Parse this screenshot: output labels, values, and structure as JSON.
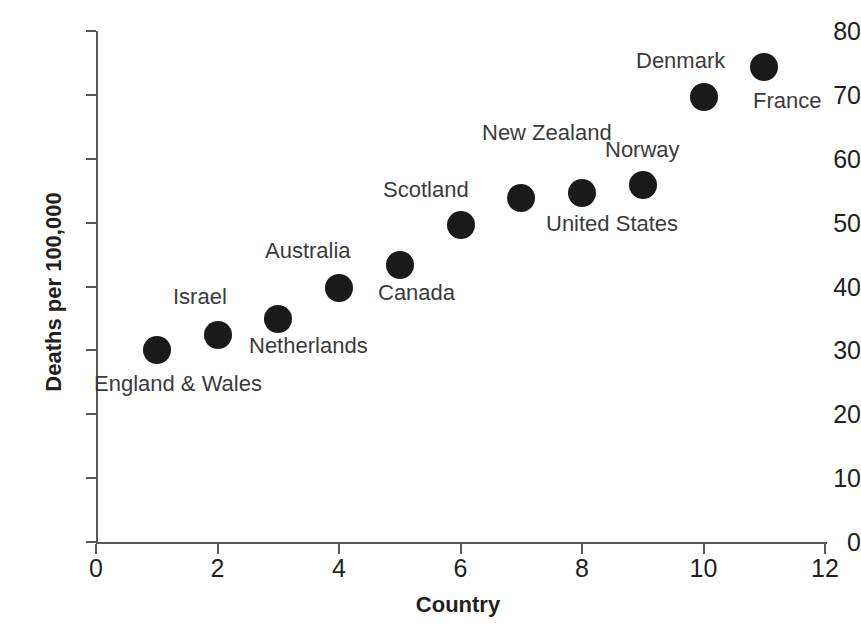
{
  "chart_data": {
    "type": "scatter",
    "title": "",
    "xlabel": "Country",
    "ylabel": "Deaths per 100,000",
    "xlim": [
      0,
      12
    ],
    "ylim": [
      0,
      80
    ],
    "xticks": [
      0,
      2,
      4,
      6,
      8,
      10,
      12
    ],
    "yticks": [
      0,
      10,
      20,
      30,
      40,
      50,
      60,
      70,
      80
    ],
    "grid": false,
    "legend": "none",
    "marker_color": "#1a1a1a",
    "axis_color": "#58595b",
    "points": [
      {
        "label": "England & Wales",
        "x": 1,
        "y": 30.0
      },
      {
        "label": "Israel",
        "x": 2,
        "y": 32.4
      },
      {
        "label": "Netherlands",
        "x": 3,
        "y": 34.9
      },
      {
        "label": "Australia",
        "x": 4,
        "y": 39.7
      },
      {
        "label": "Canada",
        "x": 5,
        "y": 43.4
      },
      {
        "label": "Scotland",
        "x": 6,
        "y": 49.6
      },
      {
        "label": "New Zealand",
        "x": 7,
        "y": 53.9
      },
      {
        "label": "United States",
        "x": 8,
        "y": 54.7
      },
      {
        "label": "Norway",
        "x": 9,
        "y": 55.9
      },
      {
        "label": "Denmark",
        "x": 10,
        "y": 69.6
      },
      {
        "label": "France",
        "x": 11,
        "y": 74.3
      }
    ]
  },
  "annotations": [
    {
      "text": "England & Wales",
      "left": 94,
      "top": 372
    },
    {
      "text": "Israel",
      "left": 173,
      "top": 285
    },
    {
      "text": "Netherlands",
      "left": 249,
      "top": 334
    },
    {
      "text": "Australia",
      "left": 265,
      "top": 239
    },
    {
      "text": "Canada",
      "left": 378,
      "top": 281
    },
    {
      "text": "Scotland",
      "left": 383,
      "top": 178
    },
    {
      "text": "New Zealand",
      "left": 482,
      "top": 121
    },
    {
      "text": "United States",
      "left": 546,
      "top": 212
    },
    {
      "text": "Norway",
      "left": 605,
      "top": 138
    },
    {
      "text": "Denmark",
      "left": 636,
      "top": 49
    },
    {
      "text": "France",
      "left": 753,
      "top": 89
    }
  ]
}
